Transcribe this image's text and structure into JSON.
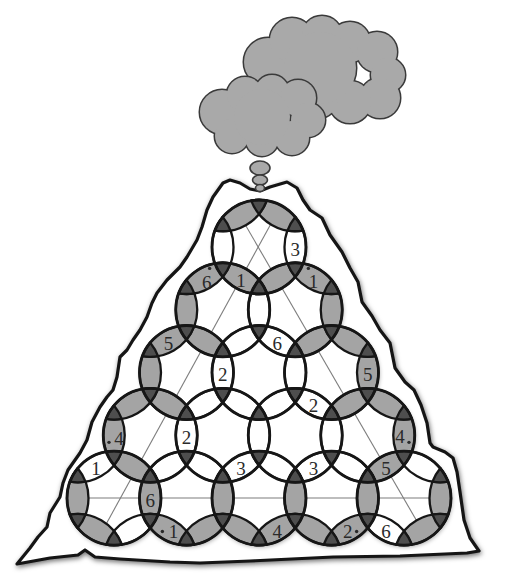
{
  "colors": {
    "background": "#ffffff",
    "outline": "#161616",
    "cell_gray": "#a4a4a4",
    "cell_white": "#ffffff",
    "junction_dark": "#4e4e4e",
    "cloud": "#a9a9a9",
    "cloud_outline": "#3a3a3a",
    "guide_line": "#7d7d7d",
    "text": "#2a2a2a"
  },
  "illustration": {
    "elements": [
      "volcano",
      "large-cloud",
      "small-cloud",
      "smoke-bubbles",
      "ring-puzzle-grid"
    ]
  },
  "puzzle": {
    "rows": 5,
    "rings": [
      [
        0,
        0
      ],
      [
        1,
        0
      ],
      [
        1,
        1
      ],
      [
        2,
        0
      ],
      [
        2,
        1
      ],
      [
        2,
        2
      ],
      [
        3,
        0
      ],
      [
        3,
        1
      ],
      [
        3,
        2
      ],
      [
        3,
        3
      ],
      [
        4,
        0
      ],
      [
        4,
        1
      ],
      [
        4,
        2
      ],
      [
        4,
        3
      ],
      [
        4,
        4
      ]
    ],
    "cells": [
      {
        "a": [
          0,
          0
        ],
        "b": [
          0,
          1
        ],
        "fill": "white"
      },
      {
        "a": [
          0,
          0
        ],
        "b": [
          0,
          -1
        ],
        "fill": "white"
      },
      {
        "a": [
          0,
          0
        ],
        "b": [
          -1,
          0
        ],
        "fill": "gray"
      },
      {
        "a": [
          0,
          0
        ],
        "b": [
          -1,
          -1
        ],
        "fill": "gray"
      },
      {
        "a": [
          0,
          0
        ],
        "b": [
          1,
          1
        ],
        "fill": "gray"
      },
      {
        "a": [
          0,
          0
        ],
        "b": [
          1,
          0
        ],
        "fill": "gray"
      },
      {
        "a": [
          1,
          0
        ],
        "b": [
          1,
          1
        ],
        "fill": "white"
      },
      {
        "a": [
          1,
          0
        ],
        "b": [
          1,
          -1
        ],
        "fill": "gray"
      },
      {
        "a": [
          1,
          0
        ],
        "b": [
          0,
          -1
        ],
        "fill": "gray"
      },
      {
        "a": [
          1,
          0
        ],
        "b": [
          2,
          1
        ],
        "fill": "white"
      },
      {
        "a": [
          1,
          0
        ],
        "b": [
          2,
          0
        ],
        "fill": "gray"
      },
      {
        "a": [
          1,
          1
        ],
        "b": [
          1,
          2
        ],
        "fill": "gray"
      },
      {
        "a": [
          1,
          1
        ],
        "b": [
          0,
          1
        ],
        "fill": "gray"
      },
      {
        "a": [
          1,
          1
        ],
        "b": [
          2,
          2
        ],
        "fill": "gray"
      },
      {
        "a": [
          1,
          1
        ],
        "b": [
          2,
          1
        ],
        "fill": "white"
      },
      {
        "a": [
          2,
          0
        ],
        "b": [
          2,
          1
        ],
        "fill": "white"
      },
      {
        "a": [
          2,
          0
        ],
        "b": [
          2,
          -1
        ],
        "fill": "gray"
      },
      {
        "a": [
          2,
          0
        ],
        "b": [
          1,
          -1
        ],
        "fill": "gray"
      },
      {
        "a": [
          2,
          0
        ],
        "b": [
          3,
          1
        ],
        "fill": "white"
      },
      {
        "a": [
          2,
          0
        ],
        "b": [
          3,
          0
        ],
        "fill": "gray"
      },
      {
        "a": [
          2,
          1
        ],
        "b": [
          2,
          2
        ],
        "fill": "white"
      },
      {
        "a": [
          2,
          1
        ],
        "b": [
          3,
          2
        ],
        "fill": "white"
      },
      {
        "a": [
          2,
          1
        ],
        "b": [
          3,
          1
        ],
        "fill": "white"
      },
      {
        "a": [
          2,
          2
        ],
        "b": [
          2,
          3
        ],
        "fill": "gray"
      },
      {
        "a": [
          2,
          2
        ],
        "b": [
          1,
          2
        ],
        "fill": "gray"
      },
      {
        "a": [
          2,
          2
        ],
        "b": [
          3,
          3
        ],
        "fill": "gray"
      },
      {
        "a": [
          2,
          2
        ],
        "b": [
          3,
          2
        ],
        "fill": "white"
      },
      {
        "a": [
          3,
          0
        ],
        "b": [
          3,
          1
        ],
        "fill": "white"
      },
      {
        "a": [
          3,
          0
        ],
        "b": [
          3,
          -1
        ],
        "fill": "gray"
      },
      {
        "a": [
          3,
          0
        ],
        "b": [
          2,
          -1
        ],
        "fill": "gray"
      },
      {
        "a": [
          3,
          0
        ],
        "b": [
          4,
          1
        ],
        "fill": "white"
      },
      {
        "a": [
          3,
          0
        ],
        "b": [
          4,
          0
        ],
        "fill": "gray"
      },
      {
        "a": [
          3,
          1
        ],
        "b": [
          3,
          2
        ],
        "fill": "white"
      },
      {
        "a": [
          3,
          1
        ],
        "b": [
          4,
          2
        ],
        "fill": "white"
      },
      {
        "a": [
          3,
          1
        ],
        "b": [
          4,
          1
        ],
        "fill": "white"
      },
      {
        "a": [
          3,
          2
        ],
        "b": [
          3,
          3
        ],
        "fill": "white"
      },
      {
        "a": [
          3,
          2
        ],
        "b": [
          4,
          3
        ],
        "fill": "white"
      },
      {
        "a": [
          3,
          2
        ],
        "b": [
          4,
          2
        ],
        "fill": "white"
      },
      {
        "a": [
          3,
          3
        ],
        "b": [
          3,
          4
        ],
        "fill": "gray"
      },
      {
        "a": [
          3,
          3
        ],
        "b": [
          2,
          3
        ],
        "fill": "gray"
      },
      {
        "a": [
          3,
          3
        ],
        "b": [
          4,
          4
        ],
        "fill": "gray"
      },
      {
        "a": [
          3,
          3
        ],
        "b": [
          4,
          3
        ],
        "fill": "white"
      },
      {
        "a": [
          4,
          0
        ],
        "b": [
          4,
          1
        ],
        "fill": "gray"
      },
      {
        "a": [
          4,
          0
        ],
        "b": [
          4,
          -1
        ],
        "fill": "gray"
      },
      {
        "a": [
          4,
          0
        ],
        "b": [
          3,
          -1
        ],
        "fill": "white"
      },
      {
        "a": [
          4,
          0
        ],
        "b": [
          5,
          1
        ],
        "fill": "white"
      },
      {
        "a": [
          4,
          0
        ],
        "b": [
          5,
          0
        ],
        "fill": "gray"
      },
      {
        "a": [
          4,
          1
        ],
        "b": [
          4,
          2
        ],
        "fill": "gray"
      },
      {
        "a": [
          4,
          1
        ],
        "b": [
          5,
          2
        ],
        "fill": "gray"
      },
      {
        "a": [
          4,
          1
        ],
        "b": [
          5,
          1
        ],
        "fill": "gray"
      },
      {
        "a": [
          4,
          2
        ],
        "b": [
          4,
          3
        ],
        "fill": "gray"
      },
      {
        "a": [
          4,
          2
        ],
        "b": [
          5,
          3
        ],
        "fill": "gray"
      },
      {
        "a": [
          4,
          2
        ],
        "b": [
          5,
          2
        ],
        "fill": "gray"
      },
      {
        "a": [
          4,
          3
        ],
        "b": [
          4,
          4
        ],
        "fill": "gray"
      },
      {
        "a": [
          4,
          3
        ],
        "b": [
          5,
          4
        ],
        "fill": "gray"
      },
      {
        "a": [
          4,
          3
        ],
        "b": [
          5,
          3
        ],
        "fill": "gray"
      },
      {
        "a": [
          4,
          4
        ],
        "b": [
          4,
          5
        ],
        "fill": "gray"
      },
      {
        "a": [
          4,
          4
        ],
        "b": [
          3,
          4
        ],
        "fill": "white"
      },
      {
        "a": [
          4,
          4
        ],
        "b": [
          5,
          5
        ],
        "fill": "gray"
      },
      {
        "a": [
          4,
          4
        ],
        "b": [
          5,
          4
        ],
        "fill": "white"
      }
    ],
    "clues": [
      {
        "a": [
          0,
          0
        ],
        "b": [
          0,
          1
        ],
        "value": "3",
        "dot": null
      },
      {
        "a": [
          0,
          0
        ],
        "b": [
          1,
          0
        ],
        "value": "1",
        "dot": null
      },
      {
        "a": [
          1,
          0
        ],
        "b": [
          0,
          -1
        ],
        "value": "6",
        "dot": "above"
      },
      {
        "a": [
          1,
          1
        ],
        "b": [
          0,
          1
        ],
        "value": "1",
        "dot": "above-left"
      },
      {
        "a": [
          2,
          0
        ],
        "b": [
          1,
          -1
        ],
        "value": "5",
        "dot": null
      },
      {
        "a": [
          1,
          1
        ],
        "b": [
          2,
          1
        ],
        "value": "6",
        "dot": null
      },
      {
        "a": [
          2,
          0
        ],
        "b": [
          2,
          1
        ],
        "value": "2",
        "dot": null
      },
      {
        "a": [
          2,
          2
        ],
        "b": [
          2,
          3
        ],
        "value": "5",
        "dot": null
      },
      {
        "a": [
          2,
          2
        ],
        "b": [
          3,
          2
        ],
        "value": "2",
        "dot": null
      },
      {
        "a": [
          3,
          0
        ],
        "b": [
          3,
          -1
        ],
        "value": "4",
        "dot": "lower-left"
      },
      {
        "a": [
          3,
          0
        ],
        "b": [
          3,
          1
        ],
        "value": "2",
        "dot": null
      },
      {
        "a": [
          3,
          3
        ],
        "b": [
          3,
          4
        ],
        "value": "4",
        "dot": "lower-right"
      },
      {
        "a": [
          4,
          0
        ],
        "b": [
          3,
          -1
        ],
        "value": "1",
        "dot": null
      },
      {
        "a": [
          3,
          1
        ],
        "b": [
          4,
          2
        ],
        "value": "3",
        "dot": null
      },
      {
        "a": [
          3,
          2
        ],
        "b": [
          4,
          3
        ],
        "value": "3",
        "dot": null
      },
      {
        "a": [
          3,
          3
        ],
        "b": [
          4,
          4
        ],
        "value": "5",
        "dot": null
      },
      {
        "a": [
          4,
          0
        ],
        "b": [
          4,
          1
        ],
        "value": "6",
        "dot": null
      },
      {
        "a": [
          4,
          1
        ],
        "b": [
          5,
          1
        ],
        "value": "1",
        "dot": "left"
      },
      {
        "a": [
          4,
          2
        ],
        "b": [
          5,
          3
        ],
        "value": "4",
        "dot": null
      },
      {
        "a": [
          4,
          3
        ],
        "b": [
          5,
          4
        ],
        "value": "2",
        "dot": "right"
      },
      {
        "a": [
          4,
          4
        ],
        "b": [
          5,
          4
        ],
        "value": "6",
        "dot": null
      }
    ]
  }
}
